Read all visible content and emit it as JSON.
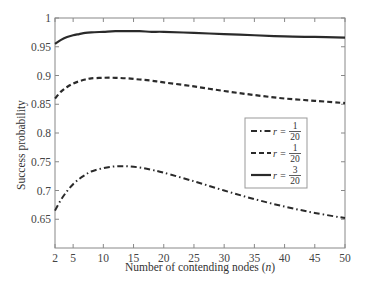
{
  "chart_data": {
    "type": "line",
    "title": "",
    "xlabel": "Number of contending nodes (n)",
    "xlabel_parts": {
      "text": "Number of contending nodes (",
      "var": "n",
      "close": ")"
    },
    "ylabel": "Success probability",
    "xlim": [
      2,
      50
    ],
    "ylim": [
      0.6,
      1.0
    ],
    "x_ticks": [
      2,
      5,
      10,
      15,
      20,
      25,
      30,
      35,
      40,
      45,
      50
    ],
    "y_ticks": [
      0.65,
      0.7,
      0.75,
      0.8,
      0.85,
      0.9,
      0.95,
      1
    ],
    "y_tick_labels": [
      "0.65",
      "0.7",
      "0.75",
      "0.8",
      "0.85",
      "0.9",
      "0.95",
      "1"
    ],
    "grid": false,
    "legend_position": "center-right",
    "x": [
      2,
      3,
      4,
      5,
      6,
      7,
      8,
      10,
      12,
      14,
      16,
      18,
      20,
      25,
      30,
      35,
      40,
      45,
      50
    ],
    "series": [
      {
        "name": "r = 1/20",
        "r_num": "1",
        "r_den": "20",
        "style": "dashdot",
        "values": [
          0.665,
          0.684,
          0.699,
          0.711,
          0.72,
          0.727,
          0.733,
          0.739,
          0.742,
          0.742,
          0.74,
          0.736,
          0.731,
          0.716,
          0.7,
          0.685,
          0.672,
          0.661,
          0.652
        ]
      },
      {
        "name": "r = 1/20",
        "r_num": "1",
        "r_den": "20",
        "style": "dashed",
        "values": [
          0.86,
          0.872,
          0.88,
          0.886,
          0.89,
          0.893,
          0.895,
          0.896,
          0.896,
          0.895,
          0.893,
          0.891,
          0.888,
          0.881,
          0.873,
          0.866,
          0.86,
          0.856,
          0.852
        ]
      },
      {
        "name": "r = 3/20",
        "r_num": "3",
        "r_den": "20",
        "style": "solid",
        "values": [
          0.955,
          0.962,
          0.967,
          0.97,
          0.972,
          0.974,
          0.975,
          0.976,
          0.977,
          0.977,
          0.977,
          0.976,
          0.976,
          0.974,
          0.972,
          0.97,
          0.968,
          0.967,
          0.966
        ]
      }
    ]
  }
}
